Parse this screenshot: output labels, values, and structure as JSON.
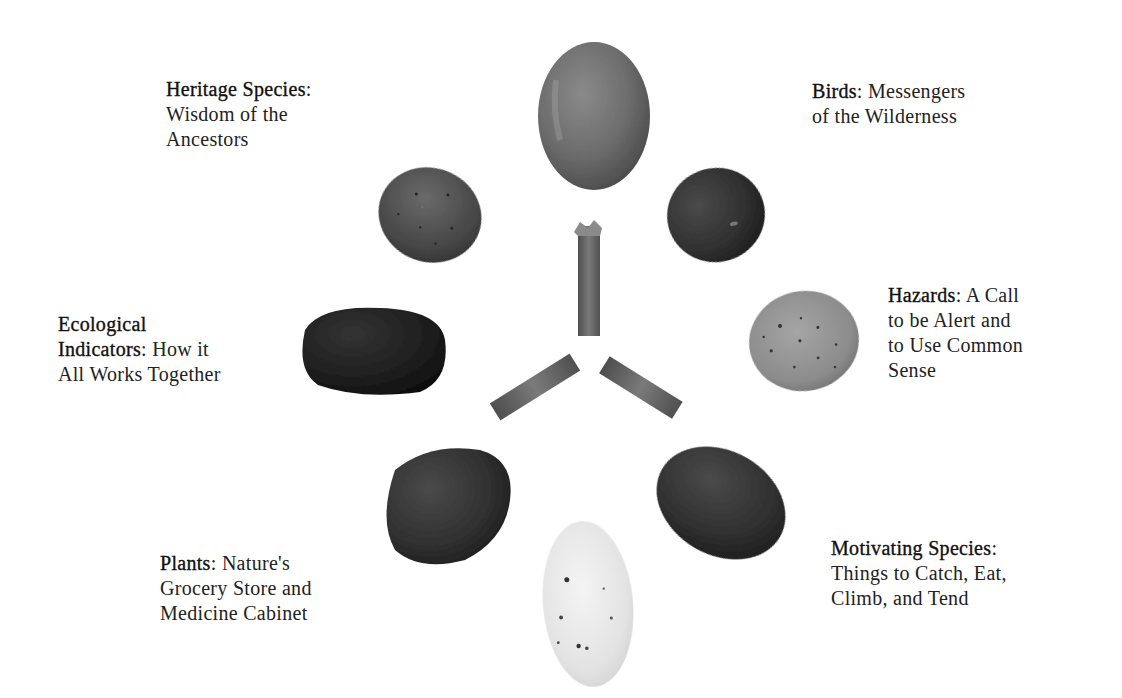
{
  "diagram": {
    "type": "medicine-wheel-of-stones",
    "center": {
      "elements": [
        {
          "name": "stick-top",
          "orientation": "vertical"
        },
        {
          "name": "stick-lower-left",
          "orientation": "diagonal-down-left"
        },
        {
          "name": "stick-lower-right",
          "orientation": "diagonal-down-right"
        }
      ]
    },
    "labels": [
      {
        "id": "heritage",
        "term": "Heritage Species",
        "separator": ":",
        "lines": [
          "Wisdom of the",
          "Ancestors"
        ]
      },
      {
        "id": "birds",
        "term": "Birds",
        "separator": ":",
        "lines": [
          "Messengers",
          "of the Wilderness"
        ]
      },
      {
        "id": "ecological",
        "term": "Ecological",
        "term2": "Indicators",
        "separator": ":",
        "lines": [
          "How it",
          "All Works Together"
        ]
      },
      {
        "id": "hazards",
        "term": "Hazards",
        "separator": ":",
        "lines": [
          "A Call",
          "to be Alert and",
          "to Use Common",
          "Sense"
        ]
      },
      {
        "id": "plants",
        "term": "Plants",
        "separator": ":",
        "lines": [
          "Nature's",
          "Grocery Store and",
          "Medicine Cabinet"
        ]
      },
      {
        "id": "motivating",
        "term": "Motivating Species",
        "separator": ":",
        "lines": [
          "Things to Catch, Eat,",
          "Climb, and Tend"
        ]
      }
    ],
    "stones": [
      {
        "position": "top",
        "shade": "medium-gray",
        "color": "#6e6e6e"
      },
      {
        "position": "upper-left",
        "shade": "speckled-dark",
        "color": "#4a4a4a"
      },
      {
        "position": "upper-right",
        "shade": "dark",
        "color": "#333333"
      },
      {
        "position": "left",
        "shade": "black",
        "color": "#1f1f1f"
      },
      {
        "position": "right",
        "shade": "speckled-light",
        "color": "#8e8e8e"
      },
      {
        "position": "lower-left",
        "shade": "dark",
        "color": "#2e2e2e"
      },
      {
        "position": "lower-right",
        "shade": "dark",
        "color": "#2a2a2a"
      },
      {
        "position": "bottom",
        "shade": "white-quartz",
        "color": "#e6e6e6"
      }
    ]
  }
}
